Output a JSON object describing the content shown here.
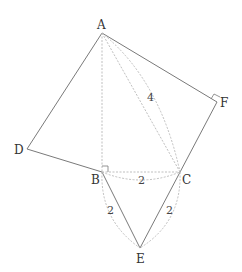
{
  "diagram": {
    "points": {
      "A": {
        "label": "A",
        "x": 102,
        "y": 33
      },
      "F": {
        "label": "F",
        "x": 217,
        "y": 102
      },
      "D": {
        "label": "D",
        "x": 27,
        "y": 149
      },
      "B": {
        "label": "B",
        "x": 102,
        "y": 172
      },
      "C": {
        "label": "C",
        "x": 180,
        "y": 172
      },
      "E": {
        "label": "E",
        "x": 140,
        "y": 248
      }
    },
    "segment_labels": {
      "AC": "4",
      "BC": "2",
      "BE": "2",
      "CE": "2"
    },
    "right_angle_marks": [
      "B",
      "F"
    ],
    "colors": {
      "solid_line": "#7a7a7a",
      "dashed_line": "#b8b8b8",
      "text": "#333333"
    }
  }
}
